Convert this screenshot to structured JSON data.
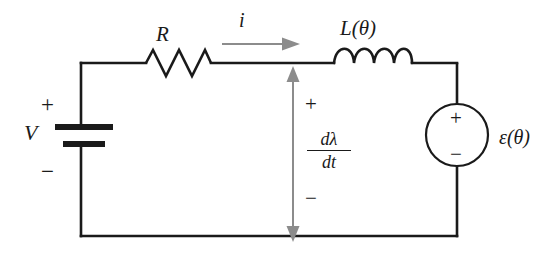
{
  "figure": {
    "background_color": "#ffffff",
    "wire_color": "#1a1a1a",
    "annotation_color": "#8c8c8c"
  },
  "components": {
    "resistor": {
      "label": "R",
      "type": "resistor",
      "zigzag_peaks": 3
    },
    "inductor": {
      "label": "L(θ)",
      "type": "inductor",
      "coil_loops": 4
    },
    "battery": {
      "label": "V",
      "type": "dc-voltage-source-battery",
      "plus_sign": "+",
      "minus_sign": "−"
    },
    "emf_source": {
      "label": "ε(θ)",
      "label_symbol": "ε",
      "label_argument": "(θ)",
      "type": "circular-voltage-source",
      "plus_sign": "+",
      "minus_sign": "−"
    }
  },
  "annotations": {
    "current_arrow": {
      "label": "i",
      "direction": "right",
      "color": "#8c8c8c"
    },
    "flux_arrow": {
      "numerator": "dλ",
      "denominator": "dt",
      "plus_sign": "+",
      "minus_sign": "−",
      "direction": "double-vertical",
      "color": "#8c8c8c"
    }
  }
}
